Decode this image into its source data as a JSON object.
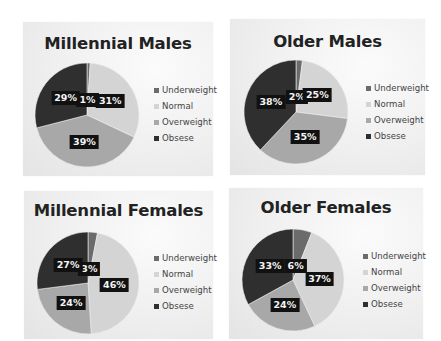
{
  "colors": {
    "Underweight": "#6b6b6b",
    "Normal": "#d4d4d4",
    "Overweight": "#a8a8a8",
    "Obsese": "#2f2f2f"
  },
  "legend_labels": [
    "Underweight",
    "Normal",
    "Overweight",
    "Obsese"
  ],
  "chart_data": [
    {
      "type": "pie",
      "title": "Millennial Males",
      "categories": [
        "Underweight",
        "Normal",
        "Overweight",
        "Obsese"
      ],
      "values": [
        1,
        31,
        39,
        29
      ],
      "labels": [
        "1%",
        "31%",
        "39%",
        "29%"
      ],
      "legend_position": "right"
    },
    {
      "type": "pie",
      "title": "Older Males",
      "categories": [
        "Underweight",
        "Normal",
        "Overweight",
        "Obsese"
      ],
      "values": [
        2,
        25,
        35,
        38
      ],
      "labels": [
        "2%",
        "25%",
        "35%",
        "38%"
      ],
      "legend_position": "right"
    },
    {
      "type": "pie",
      "title": "Millennial Females",
      "categories": [
        "Underweight",
        "Normal",
        "Overweight",
        "Obsese"
      ],
      "values": [
        3,
        46,
        24,
        27
      ],
      "labels": [
        "3%",
        "46%",
        "24%",
        "27%"
      ],
      "legend_position": "right"
    },
    {
      "type": "pie",
      "title": "Older Females",
      "categories": [
        "Underweight",
        "Normal",
        "Overweight",
        "Obsese"
      ],
      "values": [
        6,
        37,
        24,
        33
      ],
      "labels": [
        "6%",
        "37%",
        "24%",
        "33%"
      ],
      "legend_position": "right"
    }
  ]
}
